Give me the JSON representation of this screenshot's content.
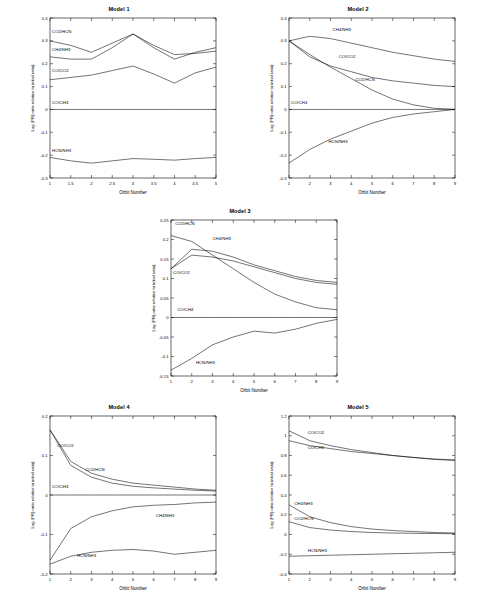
{
  "chart_data": [
    {
      "type": "line",
      "title": "Model 1",
      "xlabel": "Orbit Number",
      "ylabel": "Log (PR) ratio relative to initial ratio)",
      "xlim": [
        1,
        5
      ],
      "ylim": [
        -0.3,
        0.4
      ],
      "xticks": [
        1,
        1.5,
        2,
        2.5,
        3,
        3.5,
        4,
        4.5,
        5
      ],
      "xticklabels": [
        "1",
        "1.5",
        "2",
        "2.5",
        "3",
        "3.5",
        "4",
        "4.5",
        "5"
      ],
      "yticks": [
        -0.3,
        -0.2,
        -0.1,
        0,
        0.1,
        0.2,
        0.3,
        0.4
      ],
      "yticklabels": [
        "-0.3",
        "-0.2",
        "-0.1",
        "0",
        "0.1",
        "0.2",
        "0.3",
        "0.4"
      ],
      "series": [
        {
          "name": "CO2/HCN",
          "label": "CO2/HCN",
          "x": [
            1,
            1.5,
            2,
            2.5,
            3,
            3.5,
            4,
            4.5,
            5
          ],
          "values": [
            0.3,
            0.28,
            0.25,
            0.29,
            0.33,
            0.27,
            0.22,
            0.25,
            0.27
          ]
        },
        {
          "name": "CH4/NH3",
          "label": "CH4/NH3",
          "x": [
            1,
            1.5,
            2,
            2.5,
            3,
            3.5,
            4,
            4.5,
            5
          ],
          "values": [
            0.23,
            0.22,
            0.22,
            0.27,
            0.33,
            0.28,
            0.24,
            0.245,
            0.255
          ]
        },
        {
          "name": "CO/CO2",
          "label": "CO/CO2",
          "x": [
            1,
            1.5,
            2,
            2.5,
            3,
            3.5,
            4,
            4.5,
            5
          ],
          "values": [
            0.13,
            0.14,
            0.15,
            0.17,
            0.19,
            0.155,
            0.115,
            0.16,
            0.185
          ]
        },
        {
          "name": "CO/CH4",
          "label": "CO/CH4",
          "x": [
            1,
            1.5,
            2,
            2.5,
            3,
            3.5,
            4,
            4.5,
            5
          ],
          "values": [
            0.0,
            0.0,
            0.0,
            0.0,
            0.0,
            0.0,
            0.0,
            0.0,
            0.0
          ]
        },
        {
          "name": "HCN/NH3",
          "label": "HCN/NH3",
          "x": [
            1,
            1.5,
            2,
            2.5,
            3,
            3.5,
            4,
            4.5,
            5
          ],
          "values": [
            -0.21,
            -0.225,
            -0.235,
            -0.225,
            -0.215,
            -0.218,
            -0.222,
            -0.215,
            -0.21
          ]
        }
      ]
    },
    {
      "type": "line",
      "title": "Model 2",
      "xlabel": "Orbit Number",
      "ylabel": "Log (PR) ratio relative to initial ratio)",
      "xlim": [
        1,
        9
      ],
      "ylim": [
        -0.3,
        0.4
      ],
      "xticks": [
        1,
        2,
        3,
        4,
        5,
        6,
        7,
        8,
        9
      ],
      "xticklabels": [
        "1",
        "2",
        "3",
        "4",
        "5",
        "6",
        "7",
        "8",
        "9"
      ],
      "yticks": [
        -0.3,
        -0.2,
        -0.1,
        0,
        0.1,
        0.2,
        0.3,
        0.4
      ],
      "yticklabels": [
        "-0.3",
        "-0.2",
        "-0.1",
        "0",
        "0.1",
        "0.2",
        "0.3",
        "0.4"
      ],
      "series": [
        {
          "name": "CH4/NH3",
          "label": "CH4/NH3",
          "x": [
            1,
            2,
            3,
            4,
            5,
            6,
            7,
            8,
            9
          ],
          "values": [
            0.3,
            0.32,
            0.31,
            0.29,
            0.27,
            0.25,
            0.235,
            0.22,
            0.21
          ]
        },
        {
          "name": "CO/CO2",
          "label": "CO/CO2",
          "x": [
            1,
            2,
            3,
            4,
            5,
            6,
            7,
            8,
            9
          ],
          "values": [
            0.3,
            0.23,
            0.19,
            0.165,
            0.14,
            0.125,
            0.115,
            0.105,
            0.1
          ]
        },
        {
          "name": "CO2/HCN",
          "label": "CO2/HCN",
          "x": [
            1,
            2,
            3,
            4,
            5,
            6,
            7,
            8,
            9
          ],
          "values": [
            0.3,
            0.24,
            0.185,
            0.135,
            0.085,
            0.045,
            0.02,
            0.005,
            0.0
          ]
        },
        {
          "name": "CO/CH4",
          "label": "CO/CH4",
          "x": [
            1,
            2,
            3,
            4,
            5,
            6,
            7,
            8,
            9
          ],
          "values": [
            0.0,
            0.0,
            0.0,
            0.0,
            0.0,
            0.0,
            0.0,
            0.0,
            0.0
          ]
        },
        {
          "name": "HCN/NH3",
          "label": "HCN/NH3",
          "x": [
            1,
            2,
            3,
            4,
            5,
            6,
            7,
            8,
            9
          ],
          "values": [
            -0.235,
            -0.175,
            -0.13,
            -0.095,
            -0.06,
            -0.035,
            -0.02,
            -0.01,
            0.0
          ]
        }
      ]
    },
    {
      "type": "line",
      "title": "Model 3",
      "xlabel": "Orbit Number",
      "ylabel": "Log (PR) ratio relative to initial ratio)",
      "xlim": [
        1,
        9
      ],
      "ylim": [
        -0.15,
        0.25
      ],
      "xticks": [
        1,
        2,
        3,
        4,
        5,
        6,
        7,
        8,
        9
      ],
      "xticklabels": [
        "1",
        "2",
        "3",
        "4",
        "5",
        "6",
        "7",
        "8",
        "9"
      ],
      "yticks": [
        -0.15,
        -0.1,
        -0.05,
        0,
        0.05,
        0.1,
        0.15,
        0.2,
        0.25
      ],
      "yticklabels": [
        "-0.15",
        "-0.1",
        "-0.05",
        "0",
        "0.05",
        "0.1",
        "0.15",
        "0.2",
        "0.25"
      ],
      "series": [
        {
          "name": "CO2/HCN",
          "label": "CO2/HCN",
          "x": [
            1,
            2,
            3,
            4,
            5,
            6,
            7,
            8,
            9
          ],
          "values": [
            0.21,
            0.195,
            0.16,
            0.125,
            0.09,
            0.06,
            0.04,
            0.025,
            0.02
          ]
        },
        {
          "name": "CH4/NH3",
          "label": "CH4/NH3",
          "x": [
            1,
            2,
            3,
            4,
            5,
            6,
            7,
            8,
            9
          ],
          "values": [
            0.125,
            0.175,
            0.17,
            0.155,
            0.135,
            0.12,
            0.105,
            0.095,
            0.09
          ]
        },
        {
          "name": "CO/CO2",
          "label": "CO/CO2",
          "x": [
            1,
            2,
            3,
            4,
            5,
            6,
            7,
            8,
            9
          ],
          "values": [
            0.125,
            0.16,
            0.155,
            0.145,
            0.13,
            0.115,
            0.1,
            0.09,
            0.085
          ]
        },
        {
          "name": "CO/CH4",
          "label": "CO/CH4",
          "x": [
            1,
            2,
            3,
            4,
            5,
            6,
            7,
            8,
            9
          ],
          "values": [
            0.0,
            0.0,
            0.0,
            0.0,
            0.0,
            0.0,
            0.0,
            0.0,
            0.0
          ]
        },
        {
          "name": "HCN/NH3",
          "label": "HCN/NH3",
          "x": [
            1,
            2,
            3,
            4,
            5,
            6,
            7,
            8,
            9
          ],
          "values": [
            -0.135,
            -0.105,
            -0.07,
            -0.05,
            -0.035,
            -0.04,
            -0.03,
            -0.015,
            -0.005
          ]
        }
      ]
    },
    {
      "type": "line",
      "title": "Model 4",
      "xlabel": "Orbit Number",
      "ylabel": "Log (PR) ratio relative to initial ratio)",
      "xlim": [
        1,
        9
      ],
      "ylim": [
        -0.2,
        0.2
      ],
      "xticks": [
        1,
        2,
        3,
        4,
        5,
        6,
        7,
        8,
        9
      ],
      "xticklabels": [
        "1",
        "2",
        "3",
        "4",
        "5",
        "6",
        "7",
        "8",
        "9"
      ],
      "yticks": [
        -0.2,
        -0.1,
        0,
        0.1,
        0.2
      ],
      "yticklabels": [
        "-0.2",
        "-0.1",
        "0",
        "0.1",
        "0.2"
      ],
      "series": [
        {
          "name": "CO/CO2",
          "label": "CO/CO2",
          "x": [
            1,
            2,
            3,
            4,
            5,
            6,
            7,
            8,
            9
          ],
          "values": [
            0.165,
            0.085,
            0.055,
            0.04,
            0.03,
            0.025,
            0.02,
            0.015,
            0.012
          ]
        },
        {
          "name": "CO2/HCN",
          "label": "CO2/HCN",
          "x": [
            1,
            2,
            3,
            4,
            5,
            6,
            7,
            8,
            9
          ],
          "values": [
            0.165,
            0.075,
            0.045,
            0.03,
            0.022,
            0.018,
            0.015,
            0.012,
            0.01
          ]
        },
        {
          "name": "CO/CH4",
          "label": "CO/CH4",
          "x": [
            1,
            2,
            3,
            4,
            5,
            6,
            7,
            8,
            9
          ],
          "values": [
            0.0,
            0.0,
            0.0,
            0.0,
            0.0,
            0.0,
            0.0,
            0.0,
            0.0
          ]
        },
        {
          "name": "CH4/NH3",
          "label": "CH4/NH3",
          "x": [
            1,
            2,
            3,
            4,
            5,
            6,
            7,
            8,
            9
          ],
          "values": [
            -0.165,
            -0.085,
            -0.055,
            -0.04,
            -0.03,
            -0.026,
            -0.024,
            -0.02,
            -0.018
          ]
        },
        {
          "name": "HCN/NH3",
          "label": "HCN/NH3",
          "x": [
            1,
            2,
            3,
            4,
            5,
            6,
            7,
            8,
            9
          ],
          "values": [
            -0.175,
            -0.155,
            -0.145,
            -0.14,
            -0.138,
            -0.142,
            -0.15,
            -0.145,
            -0.14
          ]
        }
      ]
    },
    {
      "type": "line",
      "title": "Model 5",
      "xlabel": "Orbit Number",
      "ylabel": "Log (PR) ratio relative to initial ratio)",
      "xlim": [
        1,
        9
      ],
      "ylim": [
        -0.4,
        1.2
      ],
      "xticks": [
        1,
        2,
        3,
        4,
        5,
        6,
        7,
        8,
        9
      ],
      "xticklabels": [
        "1",
        "2",
        "3",
        "4",
        "5",
        "6",
        "7",
        "8",
        "9"
      ],
      "yticks": [
        -0.4,
        -0.2,
        0,
        0.2,
        0.4,
        0.6,
        0.8,
        1,
        1.2
      ],
      "yticklabels": [
        "-0.4",
        "-0.2",
        "0",
        "0.2",
        "0.4",
        "0.6",
        "0.8",
        "1",
        "1.2"
      ],
      "series": [
        {
          "name": "CO/CO2",
          "label": "CO/CO2",
          "x": [
            1,
            2,
            3,
            4,
            5,
            6,
            7,
            8,
            9
          ],
          "values": [
            1.05,
            0.95,
            0.9,
            0.86,
            0.83,
            0.8,
            0.78,
            0.76,
            0.75
          ]
        },
        {
          "name": "CO/CH4",
          "label": "CO/CH4",
          "x": [
            1,
            2,
            3,
            4,
            5,
            6,
            7,
            8,
            9
          ],
          "values": [
            0.95,
            0.9,
            0.87,
            0.84,
            0.82,
            0.8,
            0.78,
            0.765,
            0.755
          ]
        },
        {
          "name": "CH4/NH3",
          "label": "CH4/NH3",
          "x": [
            1,
            2,
            3,
            4,
            5,
            6,
            7,
            8,
            9
          ],
          "values": [
            0.3,
            0.18,
            0.12,
            0.08,
            0.055,
            0.04,
            0.03,
            0.02,
            0.015
          ]
        },
        {
          "name": "CO2/HCN",
          "label": "CO2/HCN",
          "x": [
            1,
            2,
            3,
            4,
            5,
            6,
            7,
            8,
            9
          ],
          "values": [
            0.13,
            0.07,
            0.045,
            0.03,
            0.02,
            0.015,
            0.012,
            0.01,
            0.008
          ]
        },
        {
          "name": "HCN/NH3",
          "label": "HCN/NH3",
          "x": [
            1,
            2,
            3,
            4,
            5,
            6,
            7,
            8,
            9
          ],
          "values": [
            -0.22,
            -0.215,
            -0.21,
            -0.205,
            -0.2,
            -0.195,
            -0.19,
            -0.185,
            -0.18
          ]
        }
      ]
    }
  ],
  "labels": {
    "model1": {
      "title": "Model 1",
      "xlabel": "Orbit Number",
      "ylabel": "Log (PR) ratio relative to initial ratio)",
      "s": [
        "CO2/HCN",
        "CH4/NH3",
        "CO/CO2",
        "CO/CH4",
        "HCN/NH3"
      ],
      "x": [
        "1",
        "1.5",
        "2",
        "2.5",
        "3",
        "3.5",
        "4",
        "4.5",
        "5"
      ],
      "y": [
        "-0.3",
        "-0.2",
        "-0.1",
        "0",
        "0.1",
        "0.2",
        "0.3",
        "0.4"
      ]
    },
    "model2": {
      "title": "Model 2",
      "xlabel": "Orbit Number",
      "ylabel": "Log (PR) ratio relative to initial ratio)",
      "s": [
        "CH4/NH3",
        "CO/CO2",
        "CO2/HCN",
        "CO/CH4",
        "HCN/NH3"
      ],
      "x": [
        "1",
        "2",
        "3",
        "4",
        "5",
        "6",
        "7",
        "8",
        "9"
      ],
      "y": [
        "-0.3",
        "-0.2",
        "-0.1",
        "0",
        "0.1",
        "0.2",
        "0.3",
        "0.4"
      ]
    },
    "model3": {
      "title": "Model 3",
      "xlabel": "Orbit Number",
      "ylabel": "Log (PR) ratio relative to initial ratio)",
      "s": [
        "CO2/HCN",
        "CH4/NH3",
        "CO/CO2",
        "CO/CH4",
        "HCN/NH3"
      ],
      "x": [
        "1",
        "2",
        "3",
        "4",
        "5",
        "6",
        "7",
        "8",
        "9"
      ],
      "y": [
        "-0.15",
        "-0.1",
        "-0.05",
        "0",
        "0.05",
        "0.1",
        "0.15",
        "0.2",
        "0.25"
      ]
    },
    "model4": {
      "title": "Model 4",
      "xlabel": "Orbit Number",
      "ylabel": "Log (PR) ratio relative to initial ratio)",
      "s": [
        "CO/CO2",
        "CO2/HCN",
        "CO/CH4",
        "CH4/NH3",
        "HCN/NH3"
      ],
      "x": [
        "1",
        "2",
        "3",
        "4",
        "5",
        "6",
        "7",
        "8",
        "9"
      ],
      "y": [
        "-0.2",
        "-0.1",
        "0",
        "0.1",
        "0.2"
      ]
    },
    "model5": {
      "title": "Model 5",
      "xlabel": "Orbit Number",
      "ylabel": "Log (PR) ratio relative to initial ratio)",
      "s": [
        "CO/CO2",
        "CO/CH4",
        "CH4/NH3",
        "CO2/HCN",
        "HCN/NH3"
      ],
      "x": [
        "1",
        "2",
        "3",
        "4",
        "5",
        "6",
        "7",
        "8",
        "9"
      ],
      "y": [
        "-0.4",
        "-0.2",
        "0",
        "0.2",
        "0.4",
        "0.6",
        "0.8",
        "1",
        "1.2"
      ]
    }
  }
}
